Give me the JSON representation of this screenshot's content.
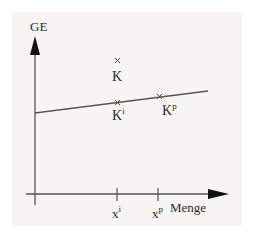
{
  "diagram": {
    "type": "economic-diagram",
    "axes": {
      "y_label": "GE",
      "x_label": "Menge"
    },
    "points": [
      {
        "id": "K",
        "label": "K",
        "sup": ""
      },
      {
        "id": "Ki",
        "label": "K",
        "sup": "i"
      },
      {
        "id": "Kp",
        "label": "K",
        "sup": "p"
      }
    ],
    "x_ticks": [
      {
        "label": "x",
        "sup": "i"
      },
      {
        "label": "x",
        "sup": "p"
      }
    ],
    "colors": {
      "background": "#f8f4f4",
      "line": "#555555",
      "text": "#2a2a2a"
    }
  }
}
